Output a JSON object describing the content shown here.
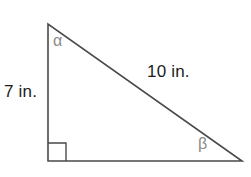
{
  "figure": {
    "type": "right-triangle-diagram",
    "background_color": "#ffffff",
    "stroke_color": "#4a4a4a",
    "dimension_text_color": "#1c1c1c",
    "angle_text_color": "#8a8a8a"
  },
  "labels": {
    "vertical_leg": "7 in.",
    "hypotenuse": "10 in.",
    "angle_alpha": "α",
    "angle_beta": "β"
  },
  "geometry": {
    "vertices": {
      "top": {
        "x": 48,
        "y": 24
      },
      "bottom_left": {
        "x": 48,
        "y": 161
      },
      "bottom_right": {
        "x": 242,
        "y": 161
      }
    },
    "right_angle_marker": {
      "at": "bottom_left",
      "size": 18
    },
    "sides": {
      "vertical_leg_label": "7 in.",
      "hypotenuse_label": "10 in.",
      "horizontal_leg_label": ""
    }
  }
}
